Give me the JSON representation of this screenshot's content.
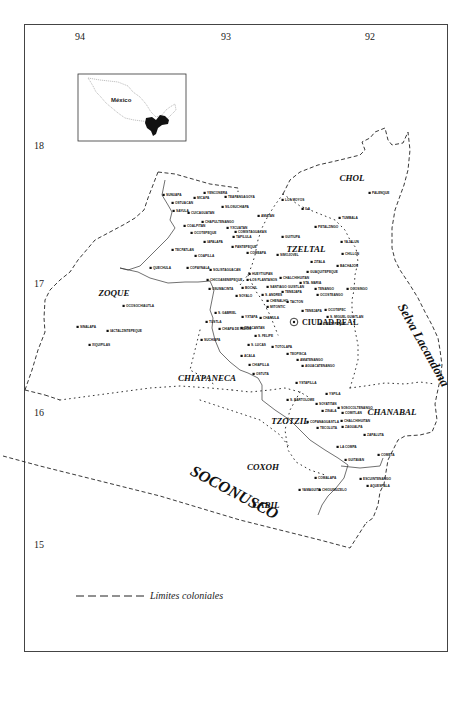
{
  "map": {
    "coordinates": {
      "longitudes": [
        {
          "label": "94",
          "x": 75,
          "y": 40
        },
        {
          "label": "93",
          "x": 221,
          "y": 40
        },
        {
          "label": "92",
          "x": 365,
          "y": 40
        }
      ],
      "latitudes": [
        {
          "label": "18",
          "x": 34,
          "y": 149
        },
        {
          "label": "17",
          "x": 34,
          "y": 287
        },
        {
          "label": "16",
          "x": 34,
          "y": 416
        },
        {
          "label": "15",
          "x": 34,
          "y": 548
        }
      ]
    },
    "inset": {
      "label": "México"
    },
    "regions": [
      {
        "name": "CHOL",
        "x": 352,
        "y": 181,
        "size": 9,
        "rotate": 0
      },
      {
        "name": "TZELTAL",
        "x": 306,
        "y": 252,
        "size": 9,
        "rotate": 0
      },
      {
        "name": "ZOQUE",
        "x": 114,
        "y": 296,
        "size": 9,
        "rotate": 0
      },
      {
        "name": "CHIAPANECA",
        "x": 207,
        "y": 381,
        "size": 9,
        "rotate": 0
      },
      {
        "name": "TZOTZIL",
        "x": 290,
        "y": 424,
        "size": 9,
        "rotate": 0
      },
      {
        "name": "CHANABAL",
        "x": 392,
        "y": 415,
        "size": 9,
        "rotate": 0
      },
      {
        "name": "COXOH",
        "x": 263,
        "y": 470,
        "size": 9,
        "rotate": 0
      },
      {
        "name": "CABIL",
        "x": 266,
        "y": 508,
        "size": 9,
        "rotate": 0
      },
      {
        "name": "SOCONUSCO",
        "x": 232,
        "y": 497,
        "size": 16,
        "rotate": 28
      },
      {
        "name": "Selva Lacandona",
        "x": 420,
        "y": 347,
        "size": 13,
        "rotate": 61
      }
    ],
    "capital": {
      "name": "CIUDAD REAL",
      "x": 301,
      "y": 325
    },
    "towns": [
      {
        "name": "SUNUAPA",
        "x": 166,
        "y": 195
      },
      {
        "name": "YENCONERA",
        "x": 207,
        "y": 193
      },
      {
        "name": "MICAPA",
        "x": 197,
        "y": 198
      },
      {
        "name": "TEAPANGAGOYA",
        "x": 228,
        "y": 197
      },
      {
        "name": "OSTUACAN",
        "x": 175,
        "y": 203
      },
      {
        "name": "SILOSUCHIAPA",
        "x": 225,
        "y": 207
      },
      {
        "name": "CUICAGUATAN",
        "x": 191,
        "y": 213
      },
      {
        "name": "SAYULA",
        "x": 176,
        "y": 211
      },
      {
        "name": "COALPITAN",
        "x": 187,
        "y": 226
      },
      {
        "name": "CHAPULTENANGO",
        "x": 205,
        "y": 222
      },
      {
        "name": "OCOTEPEQUE",
        "x": 194,
        "y": 233
      },
      {
        "name": "YXCUATAN",
        "x": 230,
        "y": 228
      },
      {
        "name": "COMISTAGUACAN",
        "x": 238,
        "y": 232
      },
      {
        "name": "TAPILULA",
        "x": 236,
        "y": 237
      },
      {
        "name": "IAPALAPA",
        "x": 207,
        "y": 242
      },
      {
        "name": "PANTEPEQUE",
        "x": 235,
        "y": 247
      },
      {
        "name": "TECPATLAN",
        "x": 175,
        "y": 250
      },
      {
        "name": "COAPILLA",
        "x": 198,
        "y": 256
      },
      {
        "name": "QUECHULA",
        "x": 153,
        "y": 268
      },
      {
        "name": "COPAYNALA",
        "x": 190,
        "y": 268
      },
      {
        "name": "AMATAN",
        "x": 261,
        "y": 216
      },
      {
        "name": "LOS MOYOS",
        "x": 285,
        "y": 200
      },
      {
        "name": "ILA",
        "x": 305,
        "y": 209
      },
      {
        "name": "GUITIUPA",
        "x": 285,
        "y": 237
      },
      {
        "name": "COMEAPA",
        "x": 250,
        "y": 253
      },
      {
        "name": "SIMOJOVEL",
        "x": 280,
        "y": 255
      },
      {
        "name": "TUMBALA",
        "x": 342,
        "y": 218
      },
      {
        "name": "PETALZINGO",
        "x": 318,
        "y": 227
      },
      {
        "name": "YAJALUN",
        "x": 344,
        "y": 242
      },
      {
        "name": "CHILLON",
        "x": 345,
        "y": 254
      },
      {
        "name": "PALENQUE",
        "x": 372,
        "y": 193
      },
      {
        "name": "ZITALA",
        "x": 314,
        "y": 262
      },
      {
        "name": "BACHAJON",
        "x": 340,
        "y": 266
      },
      {
        "name": "GUAQUITEPEQUE",
        "x": 310,
        "y": 272
      },
      {
        "name": "SOLISTAGUACAN",
        "x": 213,
        "y": 270
      },
      {
        "name": "HUEYTIUPAN",
        "x": 252,
        "y": 274
      },
      {
        "name": "CHICOASENEPEQUE",
        "x": 210,
        "y": 280
      },
      {
        "name": "LOS PLANTANOS",
        "x": 250,
        "y": 280
      },
      {
        "name": "CHALCHIHUITAN",
        "x": 283,
        "y": 278
      },
      {
        "name": "STA. MARIA",
        "x": 303,
        "y": 283
      },
      {
        "name": "OSUMACINTA",
        "x": 212,
        "y": 289
      },
      {
        "name": "BOCHIL",
        "x": 245,
        "y": 288
      },
      {
        "name": "SANTIAGO GUISTLAN",
        "x": 270,
        "y": 287
      },
      {
        "name": "TENANGO",
        "x": 318,
        "y": 289
      },
      {
        "name": "OCOSINGO",
        "x": 350,
        "y": 289
      },
      {
        "name": "SOYALO",
        "x": 239,
        "y": 296
      },
      {
        "name": "S. ANDRES",
        "x": 265,
        "y": 295
      },
      {
        "name": "TENEJAPA_CHALCH",
        "x": 285,
        "y": 292
      },
      {
        "name": "OCOSTEANGO",
        "x": 320,
        "y": 295
      },
      {
        "name": "CHAMULA_CHENALHO",
        "x": 270,
        "y": 301
      },
      {
        "name": "MITONTIC",
        "x": 270,
        "y": 307
      },
      {
        "name": "TACTON",
        "x": 290,
        "y": 302
      },
      {
        "name": "TENEJAPA",
        "x": 305,
        "y": 311
      },
      {
        "name": "OCOTEPEC",
        "x": 328,
        "y": 310
      },
      {
        "name": "S. GABRIEL",
        "x": 218,
        "y": 313
      },
      {
        "name": "YXTAPA",
        "x": 245,
        "y": 317
      },
      {
        "name": "CHAMULA",
        "x": 263,
        "y": 318
      },
      {
        "name": "S. MIGUEL GUISTLAN",
        "x": 330,
        "y": 317
      },
      {
        "name": "GUILTEPEQUE",
        "x": 323,
        "y": 324
      },
      {
        "name": "ZINACANTAN",
        "x": 244,
        "y": 328
      },
      {
        "name": "TUSTLA",
        "x": 209,
        "y": 322
      },
      {
        "name": "CHIAPA DE INDIOS",
        "x": 222,
        "y": 329
      },
      {
        "name": "S. FELIPE",
        "x": 258,
        "y": 336
      },
      {
        "name": "SUCHIAPA",
        "x": 204,
        "y": 340
      },
      {
        "name": "S. LUCAS",
        "x": 251,
        "y": 345
      },
      {
        "name": "TOTOLAPA",
        "x": 275,
        "y": 347
      },
      {
        "name": "ACALA",
        "x": 244,
        "y": 356
      },
      {
        "name": "TEOPISCA",
        "x": 290,
        "y": 354
      },
      {
        "name": "AMATENANGO",
        "x": 300,
        "y": 360
      },
      {
        "name": "CHIAPILLA",
        "x": 252,
        "y": 365
      },
      {
        "name": "AGUACATENANGO",
        "x": 305,
        "y": 366
      },
      {
        "name": "OSTUTA",
        "x": 256,
        "y": 374
      },
      {
        "name": "YSTAPILLA",
        "x": 299,
        "y": 383
      },
      {
        "name": "OCOSOCHIAUTLA",
        "x": 126,
        "y": 306
      },
      {
        "name": "TUSTLA2",
        "x": 0,
        "y": 0,
        "hidden": true
      },
      {
        "name": "SINALAPA",
        "x": 80,
        "y": 327
      },
      {
        "name": "IACTALZINTEPEQUE",
        "x": 110,
        "y": 331
      },
      {
        "name": "XIQUIPILAS",
        "x": 92,
        "y": 345
      },
      {
        "name": "YSPILA",
        "x": 329,
        "y": 394
      },
      {
        "name": "S. BARTOLOME",
        "x": 290,
        "y": 400
      },
      {
        "name": "SOYATITAN",
        "x": 319,
        "y": 404
      },
      {
        "name": "SOSOCOLTENANGO",
        "x": 341,
        "y": 408
      },
      {
        "name": "ZISALA",
        "x": 325,
        "y": 411
      },
      {
        "name": "COMITLAN",
        "x": 345,
        "y": 413
      },
      {
        "name": "COPANAGUASTLA",
        "x": 310,
        "y": 422
      },
      {
        "name": "CHALCHIHUITAN2",
        "x": 344,
        "y": 421
      },
      {
        "name": "ZAGUALPA",
        "x": 345,
        "y": 427
      },
      {
        "name": "TECOLUTA",
        "x": 320,
        "y": 428
      },
      {
        "name": "ZAPALUTA",
        "x": 367,
        "y": 435
      },
      {
        "name": "LA COMPA",
        "x": 340,
        "y": 447
      },
      {
        "name": "COMETA",
        "x": 381,
        "y": 455
      },
      {
        "name": "GUITAVAN",
        "x": 348,
        "y": 460
      },
      {
        "name": "COMALAPA",
        "x": 318,
        "y": 478
      },
      {
        "name": "ESCUINTENANGO",
        "x": 363,
        "y": 479
      },
      {
        "name": "AQUESPALA",
        "x": 370,
        "y": 486
      },
      {
        "name": "YAMAGUITA",
        "x": 302,
        "y": 490
      },
      {
        "name": "CHIOUIMUZELO",
        "x": 322,
        "y": 490
      }
    ],
    "town_labels": {
      "SUNUAPA": "SUNUAPA",
      "YENCONERA": "YENCONERA",
      "MICAPA": "MICAPA",
      "TEAPANGAGOYA": "TEAPANGAGOYA",
      "OSTUACAN": "OSTUACAN",
      "SILOSUCHIAPA": "SILOSUCHIAPA",
      "CUICAGUATAN": "CUICAGUATAN",
      "SAYULA": "SAYULA",
      "COALPITAN": "COALPITAN",
      "CHAPULTENANGO": "CHAPULTENANGO",
      "OCOTEPEQUE": "OCOTEPEQUE",
      "YXCUATAN": "YXCUATAN",
      "COMISTAGUACAN": "COMISTAGUACAN",
      "TAPILULA": "TAPILULA",
      "IAPALAPA": "IAPALAPA",
      "PANTEPEQUE": "PANTEPEQUE",
      "TECPATLAN": "TECPATLAN",
      "COAPILLA": "COAPILLA",
      "QUECHULA": "QUECHULA",
      "COPAYNALA": "COPAYNALA",
      "AMATAN": "AMATAN",
      "LOS MOYOS": "LOS MOYOS",
      "ILA": "ILA",
      "GUITIUPA": "GUITIUPA",
      "COMEAPA": "COMEAPA",
      "SIMOJOVEL": "SIMOJOVEL",
      "TUMBALA": "TUMBALA",
      "PETALZINGO": "PETALZINGO",
      "YAJALUN": "YAJALUN",
      "CHILLON": "CHILLON",
      "PALENQUE": "PALENQUE",
      "ZITALA": "ZITALA",
      "BACHAJON": "BACHAJON",
      "GUAQUITEPEQUE": "GUAQUITEPEQUE",
      "SOLISTAGUACAN": "SOLISTAGUACAN",
      "HUEYTIUPAN": "HUEYTIUPAN",
      "CHICOASENEPEQUE": "CHICOASENEPEQUE",
      "LOS PLANTANOS": "LOS PLANTANOS",
      "CHALCHIHUITAN": "CHALCHIHUITAN",
      "STA. MARIA": "STA. MARIA",
      "OSUMACINTA": "OSUMACINTA",
      "BOCHIL": "BOCHIL",
      "SANTIAGO GUISTLAN": "SANTIAGO GUISTLAN",
      "TENANGO": "TENANGO",
      "OCOSINGO": "OCOSINGO",
      "SOYALO": "SOYALO",
      "S. ANDRES": "S. ANDRES",
      "TENEJAPA_CHALCH": "TENEJAPA",
      "OCOSTEANGO": "OCOSTEANGO",
      "CHAMULA_CHENALHO": "CHENALHO",
      "MITONTIC": "MITONTIC",
      "TACTON": "TACTON",
      "TENEJAPA": "TENEJAPA",
      "OCOTEPEC": "OCOTEPEC",
      "S. GABRIEL": "S. GABRIEL",
      "YXTAPA": "YXTAPA",
      "CHAMULA": "CHAMULA",
      "S. MIGUEL GUISTLAN": "S. MIGUEL GUISTLAN",
      "GUILTEPEQUE": "GUILTEPEQUE",
      "ZINACANTAN": "ZINACANTAN",
      "TUSTLA": "TUSTLA",
      "CHIAPA DE INDIOS": "CHIAPA DE INDIOS",
      "S. FELIPE": "S. FELIPE",
      "SUCHIAPA": "SUCHIAPA",
      "S. LUCAS": "S. LUCAS",
      "TOTOLAPA": "TOTOLAPA",
      "ACALA": "ACALA",
      "TEOPISCA": "TEOPISCA",
      "AMATENANGO": "AMATENANGO",
      "CHIAPILLA": "CHIAPILLA",
      "AGUACATENANGO": "AGUACATENANGO",
      "OSTUTA": "OSTUTA",
      "YSTAPILLA": "YSTAPILLA",
      "OCOSOCHIAUTLA": "OCOSOCHIAUTLA",
      "SINALAPA": "SINALAPA",
      "IACTALZINTEPEQUE": "IACTALZINTEPEQUE",
      "XIQUIPILAS": "XIQUIPILAS",
      "YSPILA": "YSPILA",
      "S. BARTOLOME": "S. BARTOLOME",
      "SOYATITAN": "SOYATITAN",
      "SOSOCOLTENANGO": "SOSOCOLTENANGO",
      "ZISALA": "ZISALA",
      "COMITLAN": "COMITLAN",
      "COPANAGUASTLA": "COPANAGUASTLA",
      "CHALCHIHUITAN2": "CHALCHIHUITAN",
      "ZAGUALPA": "ZAGUALPA",
      "TECOLUTA": "TECOLUTA",
      "ZAPALUTA": "ZAPALUTA",
      "LA COMPA": "LA COMPA",
      "COMETA": "COMETA",
      "GUITAVAN": "GUITAVAN",
      "COMALAPA": "COMALAPA",
      "ESCUINTENANGO": "ESCUINTENANGO",
      "AQUESPALA": "AQUESPALA",
      "YAMAGUITA": "YAMAGUITA",
      "CHIOUIMUZELO": "CHIOUIMUZELO"
    },
    "legend": {
      "label": "Límites coloniales",
      "symbol": "dashed-line"
    }
  }
}
